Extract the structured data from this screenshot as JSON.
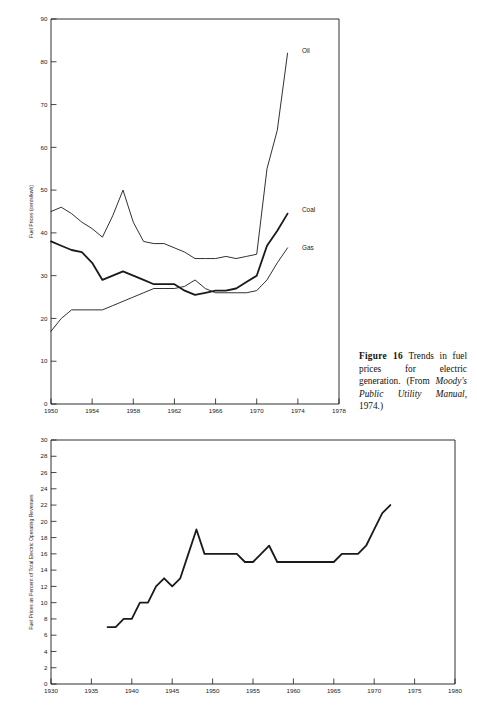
{
  "document": {
    "background_color": "#ffffff",
    "ink_color": "#1a1a1a"
  },
  "caption": {
    "figure_label": "Figure 16",
    "text_part1": " Trends in fuel prices for electric generation. (From ",
    "source_italic": "Moody's Public Utility Manual",
    "text_part2": ", 1974.)"
  },
  "chart_data": [
    {
      "id": "fuel-prices-trends",
      "type": "line",
      "title": "",
      "xlabel": "",
      "ylabel": "Fuel Prices (cents/kwh)",
      "xlim": [
        1950,
        1978
      ],
      "ylim": [
        0,
        90
      ],
      "xticks": [
        1950,
        1954,
        1958,
        1962,
        1966,
        1970,
        1974,
        1978
      ],
      "yticks": [
        0,
        10,
        20,
        30,
        40,
        50,
        60,
        70,
        80,
        90
      ],
      "xtick_labels": [
        "1950",
        "1954",
        "1958",
        "1962",
        "1966",
        "1970",
        "1974",
        "1978"
      ],
      "ytick_labels": [
        "0",
        "10",
        "20",
        "30",
        "40",
        "50",
        "60",
        "70",
        "80",
        "90"
      ],
      "grid": false,
      "legend_position": "inline-right",
      "series": [
        {
          "name": "Oil",
          "label": "Oil",
          "label_x": 1974.4,
          "label_y": 82.5,
          "line_width": 0.9,
          "x": [
            1950,
            1951,
            1952,
            1953,
            1954,
            1955,
            1956,
            1957,
            1958,
            1959,
            1960,
            1961,
            1962,
            1963,
            1964,
            1965,
            1966,
            1967,
            1968,
            1969,
            1970,
            1971,
            1972,
            1973
          ],
          "values": [
            45,
            46,
            44.5,
            42.5,
            41,
            39,
            44,
            50,
            42.5,
            38,
            37.5,
            37.5,
            36.5,
            35.5,
            34,
            34,
            34,
            34.5,
            34,
            34.5,
            35,
            55,
            64,
            82
          ]
        },
        {
          "name": "Coal",
          "label": "Coal",
          "label_x": 1974.4,
          "label_y": 45.5,
          "line_width": 1.8,
          "x": [
            1950,
            1951,
            1952,
            1953,
            1954,
            1955,
            1956,
            1957,
            1958,
            1959,
            1960,
            1961,
            1962,
            1963,
            1964,
            1965,
            1966,
            1967,
            1968,
            1969,
            1970,
            1971,
            1972,
            1973
          ],
          "values": [
            38,
            37,
            36,
            35.5,
            33,
            29,
            30,
            31,
            30,
            29,
            28,
            28,
            28,
            26.5,
            25.5,
            26,
            26.5,
            26.5,
            27,
            28.5,
            30,
            37,
            40.5,
            44.5
          ]
        },
        {
          "name": "Gas",
          "label": "Gas",
          "label_x": 1974.4,
          "label_y": 36.5,
          "line_width": 0.9,
          "x": [
            1950,
            1951,
            1952,
            1953,
            1954,
            1955,
            1956,
            1957,
            1958,
            1959,
            1960,
            1961,
            1962,
            1963,
            1964,
            1965,
            1966,
            1967,
            1968,
            1969,
            1970,
            1971,
            1972,
            1973
          ],
          "values": [
            17,
            20,
            22,
            22,
            22,
            22,
            23,
            24,
            25,
            26,
            27,
            27,
            27,
            27.5,
            29,
            27,
            26,
            26,
            26,
            26,
            26.5,
            29,
            33,
            36.5
          ]
        }
      ]
    },
    {
      "id": "fuel-prices-percent-revenues",
      "type": "line",
      "title": "",
      "xlabel": "",
      "ylabel": "Fuel Prices as Percent of Total Electric Operating Revenues",
      "xlim": [
        1930,
        1980
      ],
      "ylim": [
        0,
        30
      ],
      "xticks": [
        1930,
        1935,
        1940,
        1945,
        1950,
        1955,
        1960,
        1965,
        1970,
        1975,
        1980
      ],
      "yticks": [
        0,
        2,
        4,
        6,
        8,
        10,
        12,
        14,
        16,
        18,
        20,
        22,
        24,
        26,
        28,
        30
      ],
      "xtick_labels": [
        "1930",
        "1935",
        "1940",
        "1945",
        "1950",
        "1955",
        "1960",
        "1965",
        "1970",
        "1975",
        "1980"
      ],
      "ytick_labels": [
        "0",
        "2",
        "4",
        "6",
        "8",
        "10",
        "12",
        "14",
        "16",
        "18",
        "20",
        "22",
        "24",
        "26",
        "28",
        "30"
      ],
      "grid": false,
      "legend_position": "none",
      "series": [
        {
          "name": "Fuel Prices as Percent of Revenues",
          "label": "",
          "line_width": 1.8,
          "x": [
            1937,
            1938,
            1939,
            1940,
            1941,
            1942,
            1943,
            1944,
            1945,
            1946,
            1947,
            1948,
            1949,
            1950,
            1951,
            1952,
            1953,
            1954,
            1955,
            1956,
            1957,
            1958,
            1959,
            1960,
            1961,
            1962,
            1963,
            1964,
            1965,
            1966,
            1967,
            1968,
            1969,
            1970,
            1971,
            1972
          ],
          "values": [
            7,
            7,
            8,
            8,
            10,
            10,
            12,
            13,
            12,
            13,
            16,
            19,
            16,
            16,
            16,
            16,
            16,
            15,
            15,
            16,
            17,
            15,
            15,
            15,
            15,
            15,
            15,
            15,
            15,
            16,
            16,
            16,
            17,
            19,
            21,
            22
          ]
        }
      ]
    }
  ]
}
